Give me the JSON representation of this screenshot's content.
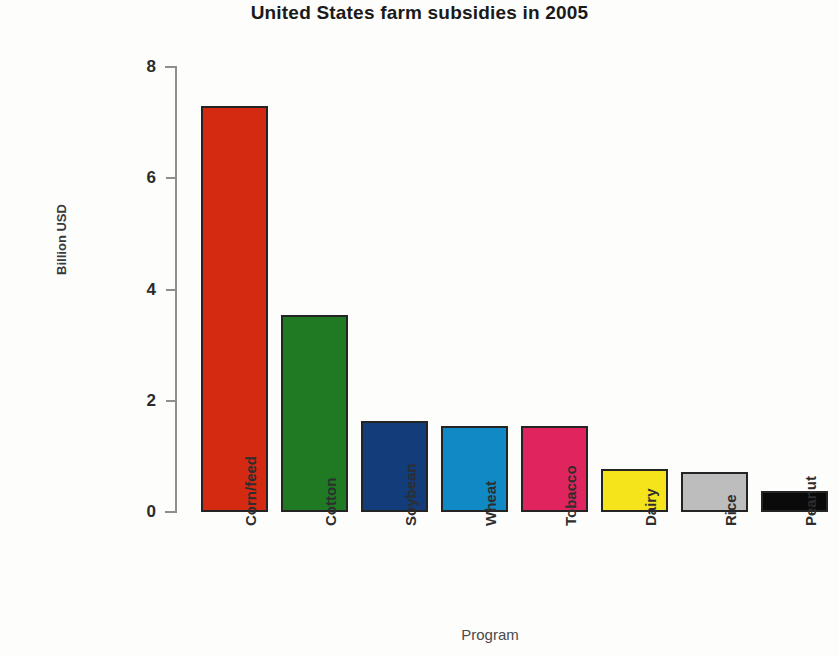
{
  "chart_data": {
    "type": "bar",
    "title": "United States farm subsidies in 2005",
    "xlabel": "Program",
    "ylabel": "Billion USD",
    "categories": [
      "Corn/feed",
      "Cotton",
      "Soybean",
      "Wheat",
      "Tobacco",
      "Dairy",
      "Rice",
      "Peanut"
    ],
    "values": [
      7.3,
      3.55,
      1.63,
      1.55,
      1.55,
      0.78,
      0.72,
      0.38
    ],
    "series": [
      {
        "name": "Billion USD",
        "values": [
          7.3,
          3.55,
          1.63,
          1.55,
          1.55,
          0.78,
          0.72,
          0.38
        ]
      }
    ],
    "bar_colors": [
      "#d42a12",
      "#1f7a23",
      "#123c7a",
      "#1189c4",
      "#e0245e",
      "#f5e31c",
      "#bdbdbd",
      "#0a0a0a"
    ],
    "bar_edge_color": "#242424",
    "ylim": [
      0,
      8
    ],
    "yticks": [
      0,
      2,
      4,
      6,
      8
    ],
    "ytick_labels": [
      "0",
      "2",
      "4",
      "6",
      "8"
    ],
    "grid": false,
    "legend": false,
    "legend_position": "none",
    "background_color": "#fdfdfc",
    "units": "Billion USD"
  },
  "axes": {
    "y_tick_labels": [
      "8",
      "6",
      "4",
      "2",
      "0"
    ]
  },
  "bars": [
    {
      "label": "Corn/feed",
      "value": 7.3,
      "color": "#d42a12"
    },
    {
      "label": "Cotton",
      "value": 3.55,
      "color": "#1f7a23"
    },
    {
      "label": "Soybean",
      "value": 1.63,
      "color": "#123c7a"
    },
    {
      "label": "Wheat",
      "value": 1.55,
      "color": "#1189c4"
    },
    {
      "label": "Tobacco",
      "value": 1.55,
      "color": "#e0245e"
    },
    {
      "label": "Dairy",
      "value": 0.78,
      "color": "#f5e31c"
    },
    {
      "label": "Rice",
      "value": 0.72,
      "color": "#bdbdbd"
    },
    {
      "label": "Peanut",
      "value": 0.38,
      "color": "#0a0a0a"
    }
  ]
}
